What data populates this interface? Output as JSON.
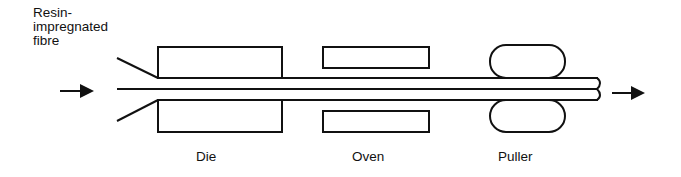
{
  "labels": {
    "input": [
      "Resin-",
      "impregnated",
      "fibre"
    ],
    "die": "Die",
    "oven": "Oven",
    "puller": "Puller"
  },
  "colors": {
    "stroke": "#111111",
    "background": "#ffffff"
  },
  "components": [
    {
      "name": "Die",
      "x": 158,
      "width": 124,
      "top_box": [
        47,
        78
      ],
      "bottom_box": [
        100,
        132
      ]
    },
    {
      "name": "Oven",
      "x": 323,
      "width": 106,
      "top_box": [
        47,
        68
      ],
      "bottom_box": [
        111,
        132
      ]
    },
    {
      "name": "Puller",
      "x": 490,
      "width": 75,
      "top_roller": [
        45,
        78
      ],
      "bottom_roller": [
        100,
        132
      ]
    }
  ],
  "flow": {
    "input_arrow": "arrow-right-icon",
    "output_arrow": "arrow-right-icon"
  }
}
